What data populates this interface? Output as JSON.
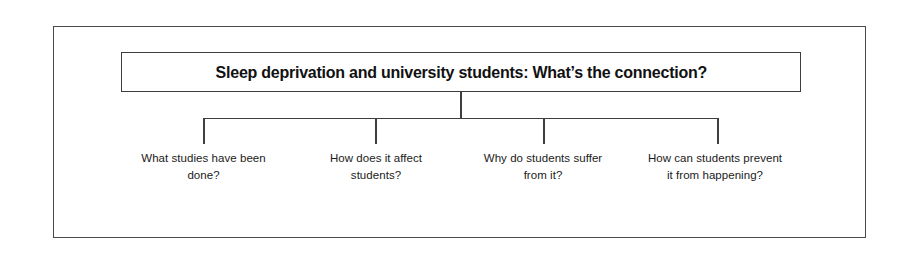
{
  "diagram": {
    "type": "tree",
    "orientation": "top-down",
    "root": {
      "label": "Sleep deprivation and university students: What’s the connection?",
      "style": "boxed-bold"
    },
    "branches": [
      {
        "label": "What studies have been done?",
        "leg_x": 203
      },
      {
        "label": "How does it affect students?",
        "leg_x": 375
      },
      {
        "label": "Why do students suffer from it?",
        "leg_x": 543
      },
      {
        "label": "How can students prevent it from happening?",
        "leg_x": 717
      }
    ],
    "colors": {
      "background": "#ffffff",
      "frame_border": "#4a4a4a",
      "box_border": "#3d3d3d",
      "connector": "#3f3f3f",
      "title_text": "#111111",
      "leaf_text": "#1b1b1b"
    }
  }
}
